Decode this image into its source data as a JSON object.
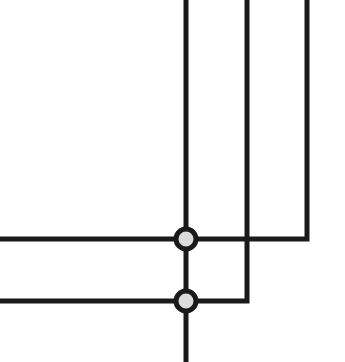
{
  "diagram": {
    "canvas": {
      "width": 345,
      "height": 362,
      "background": "#ffffff"
    },
    "style": {
      "line_color": "#1a1a1a",
      "line_width": 5,
      "node_fill": "#dcdcdc",
      "node_stroke": "#1a1a1a",
      "node_stroke_width": 5,
      "node_radius": 10
    },
    "nodes": [
      {
        "id": "junction-upper",
        "label": "",
        "cx": 186,
        "cy": 239,
        "r": 10,
        "fill": "#dcdcdc",
        "stroke": "#1a1a1a"
      },
      {
        "id": "junction-lower",
        "label": "",
        "cx": 186,
        "cy": 301,
        "r": 10,
        "fill": "#dcdcdc",
        "stroke": "#1a1a1a"
      }
    ],
    "wires": [
      {
        "id": "wire-vertical-main",
        "points": "186,0 186,362",
        "description": "main vertical bus from top edge through both junctions to bottom edge"
      },
      {
        "id": "wire-vertical-mid",
        "points": "247,0 247,301 186,301",
        "description": "middle vertical line crossing upper horizontal, turning left into lower junction"
      },
      {
        "id": "wire-vertical-right",
        "points": "307,0 307,239 186,239",
        "description": "right vertical line turning left into upper junction"
      },
      {
        "id": "wire-horizontal-upper",
        "points": "0,239 186,239",
        "description": "upper horizontal line from left edge to upper junction"
      },
      {
        "id": "wire-horizontal-lower",
        "points": "0,301 186,301",
        "description": "lower horizontal line from left edge to lower junction"
      }
    ],
    "crossings": [
      {
        "id": "crossing-mid-upper",
        "x": 247,
        "y": 239,
        "type": "non-connecting"
      }
    ]
  }
}
